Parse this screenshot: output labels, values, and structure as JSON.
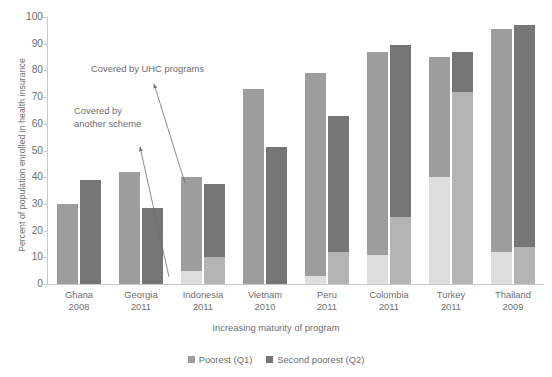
{
  "chart_data": {
    "type": "bar",
    "title": "",
    "subtitle": "",
    "xlabel": "Increasing maturity of program",
    "ylabel": "Percent of population enrolled in health insurance",
    "ylim": [
      0,
      100
    ],
    "ytick_step": 10,
    "yticks": [
      100,
      90,
      80,
      70,
      60,
      50,
      40,
      30,
      20,
      10,
      0
    ],
    "grid": false,
    "legend_position": "bottom",
    "stacked_groups": true,
    "categories": [
      "Ghana",
      "Georgia",
      "Indonesia",
      "Vietnam",
      "Peru",
      "Colombia",
      "Turkey",
      "Thailand"
    ],
    "category_years": [
      "2008",
      "2011",
      "2011",
      "2010",
      "2011",
      "2011",
      "2011",
      "2009"
    ],
    "series": [
      {
        "name": "Poorest (Q1)",
        "color": "#9d9d9d",
        "base_color": "#dedede",
        "values": [
          30,
          42,
          40,
          73,
          79,
          87,
          85,
          95.5
        ],
        "base_values": [
          0,
          0,
          5,
          0,
          3,
          11,
          40,
          12
        ]
      },
      {
        "name": "Second poorest (Q2)",
        "color": "#767676",
        "base_color": "#b4b4b4",
        "values": [
          39,
          28.5,
          37.5,
          51.5,
          63,
          89.5,
          87,
          97
        ],
        "base_values": [
          0,
          0,
          10,
          0,
          12,
          25,
          72,
          14
        ]
      }
    ],
    "segment_meaning": {
      "top": "Covered by UHC programs",
      "base": "Covered by another scheme"
    },
    "annotations": [
      {
        "id": "uhc",
        "text": "Covered by UHC programs"
      },
      {
        "id": "other",
        "text": "Covered by\nanother scheme"
      }
    ]
  },
  "legend": {
    "items": [
      {
        "label": "Poorest (Q1)"
      },
      {
        "label": "Second poorest (Q2)"
      }
    ]
  }
}
